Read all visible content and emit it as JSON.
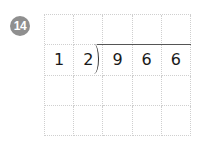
{
  "problem": {
    "number": "14",
    "divisor": "12",
    "dividend": "966",
    "rows": [
      [
        "",
        "",
        "",
        "",
        ""
      ],
      [
        "1",
        "2",
        "9",
        "6",
        "6"
      ],
      [
        "",
        "",
        "",
        "",
        ""
      ],
      [
        "",
        "",
        "",
        "",
        ""
      ]
    ]
  },
  "colors": {
    "badge": "#8f8f8f",
    "grid_line": "#cfcfcf",
    "text": "#1a1a1a"
  }
}
